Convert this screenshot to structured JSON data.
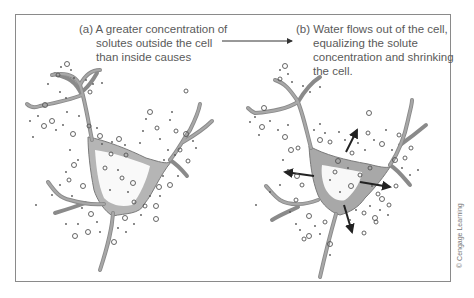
{
  "figure": {
    "panel_a": {
      "label": "(a)",
      "lines": [
        "(a) A greater concentration of",
        "solutes outside the cell",
        "than inside causes"
      ]
    },
    "panel_b": {
      "label": "(b)",
      "lines": [
        "(b) Water flows out of the cell,",
        "equalizing the solute",
        "concentration and shrinking",
        "the cell."
      ]
    },
    "connector_arrow": "arrow-right",
    "credit": "© Cengage Learning",
    "colors": {
      "frame": "#8a8a8a",
      "cell_fill": "#a8a8a8",
      "cell_outline": "#7a7a7a",
      "solute": "#555555",
      "water_arrow": "#222222",
      "text": "#5a5a5a"
    }
  }
}
